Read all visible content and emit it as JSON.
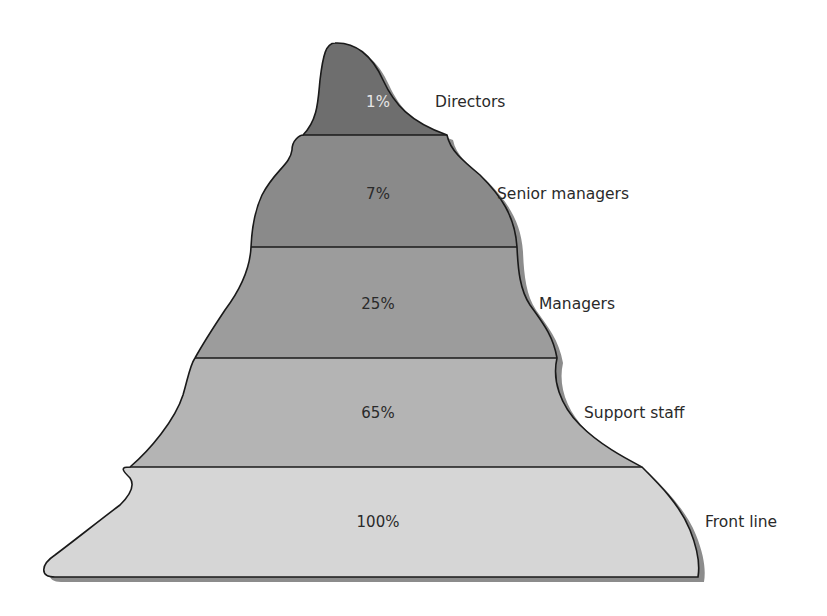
{
  "diagram": {
    "type": "stacked-mountain-pyramid",
    "levels": [
      {
        "name": "Directors",
        "percent": "1%",
        "fill": "#6e6e6e",
        "text_color": "#e6e6e6"
      },
      {
        "name": "Senior managers",
        "percent": "7%",
        "fill": "#8a8a8a",
        "text_color": "#2a2a2a"
      },
      {
        "name": "Managers",
        "percent": "25%",
        "fill": "#9c9c9c",
        "text_color": "#2a2a2a"
      },
      {
        "name": "Support staff",
        "percent": "65%",
        "fill": "#b4b4b4",
        "text_color": "#2a2a2a"
      },
      {
        "name": "Front line",
        "percent": "100%",
        "fill": "#d6d6d6",
        "text_color": "#2a2a2a"
      }
    ],
    "outline_color": "#1a1a1a",
    "shadow_color": "#8c8c8c"
  }
}
